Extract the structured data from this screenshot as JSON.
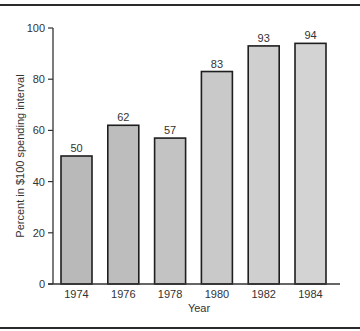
{
  "chart_data": {
    "type": "bar",
    "title": "",
    "xlabel": "Year",
    "ylabel": "Percent in $100 spending interval",
    "categories": [
      "1974",
      "1976",
      "1978",
      "1980",
      "1982",
      "1984"
    ],
    "values": [
      50,
      62,
      57,
      83,
      93,
      94
    ],
    "value_labels": [
      "50",
      "62",
      "57",
      "83",
      "93",
      "94"
    ],
    "ylim": [
      0,
      100
    ],
    "yticks": [
      0,
      20,
      40,
      60,
      80,
      100
    ],
    "ytick_labels": [
      "0",
      "20",
      "40",
      "60",
      "80",
      "100"
    ],
    "grid": false,
    "legend": null,
    "bar_colors": [
      "#b9b9b9",
      "#bdbdbd",
      "#c3c3c3",
      "#c9c9c9",
      "#cfcfcf",
      "#d3d3d3"
    ],
    "bar_edge_color": "#1e1e1e"
  }
}
